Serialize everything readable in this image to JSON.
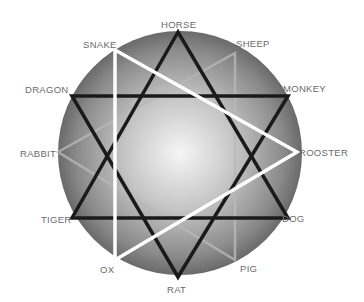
{
  "diagram": {
    "circle": {
      "cx": 180,
      "cy": 153,
      "r": 122,
      "center_color": "#f4f4f4",
      "edge_color": "#6e6e6e"
    },
    "labels": [
      {
        "id": "horse",
        "text": "HORSE",
        "x": 161,
        "y": 20
      },
      {
        "id": "snake",
        "text": "SNAKE",
        "x": 83,
        "y": 40
      },
      {
        "id": "sheep",
        "text": "SHEEP",
        "x": 236,
        "y": 39
      },
      {
        "id": "dragon",
        "text": "DRAGON",
        "x": 25,
        "y": 85
      },
      {
        "id": "monkey",
        "text": "MONKEY",
        "x": 283,
        "y": 84
      },
      {
        "id": "rabbit",
        "text": "RABBIT",
        "x": 20,
        "y": 149
      },
      {
        "id": "rooster",
        "text": "ROOSTER",
        "x": 299,
        "y": 148
      },
      {
        "id": "tiger",
        "text": "TIGER",
        "x": 41,
        "y": 215
      },
      {
        "id": "dog",
        "text": "DOG",
        "x": 282,
        "y": 214
      },
      {
        "id": "ox",
        "text": "OX",
        "x": 100,
        "y": 265
      },
      {
        "id": "pig",
        "text": "PIG",
        "x": 240,
        "y": 264
      },
      {
        "id": "rat",
        "text": "RAT",
        "x": 167,
        "y": 285
      }
    ],
    "triangles": [
      {
        "name": "black-triangle-horse-tiger-dog",
        "members": [
          "HORSE",
          "TIGER",
          "DOG"
        ],
        "points": "178,32 72,218 288,218",
        "color": "#1a1a1a",
        "width": 3.5
      },
      {
        "name": "black-triangle-rat-dragon-monkey",
        "members": [
          "RAT",
          "DRAGON",
          "MONKEY"
        ],
        "points": "178,277 72,96 288,96",
        "color": "#1a1a1a",
        "width": 3.5
      },
      {
        "name": "white-triangle-snake-rooster-ox",
        "members": [
          "SNAKE",
          "ROOSTER",
          "OX"
        ],
        "points": "115,50 297,152 115,260",
        "color": "#ffffff",
        "width": 3.5
      },
      {
        "name": "gray-triangle-sheep-rabbit-pig",
        "members": [
          "SHEEP",
          "RABBIT",
          "PIG"
        ],
        "points": "235,53 58,152 235,260",
        "color": "#b8b8b8",
        "width": 2.5
      }
    ]
  }
}
